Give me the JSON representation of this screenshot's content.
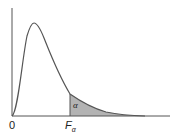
{
  "diagram": {
    "labels": {
      "origin": "0",
      "critical_value_base": "F",
      "critical_value_sub": "α",
      "area": "α"
    },
    "colors": {
      "curve": "#555555",
      "axis": "#555555",
      "shaded_area": "#b3b3b3",
      "background": "#ffffff"
    }
  }
}
